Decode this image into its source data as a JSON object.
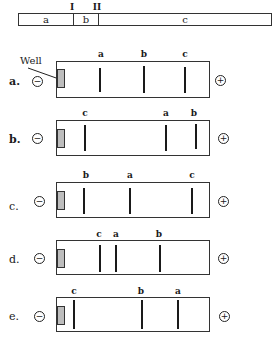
{
  "figure": {
    "map": {
      "segments": [
        {
          "label": "a",
          "width": 54
        },
        {
          "label": "b",
          "width": 25
        },
        {
          "label": "c",
          "width": 175
        }
      ],
      "cut_sites": [
        {
          "label": "I",
          "x": 72
        },
        {
          "label": "II",
          "x": 97
        }
      ]
    },
    "well_label": "Well",
    "electrodes": {
      "negative": "−",
      "positive": "+"
    },
    "gels": [
      {
        "label": "a.",
        "top": 61,
        "height": 37,
        "bands": [
          {
            "label": "a",
            "x": 100
          },
          {
            "label": "b",
            "x": 144
          },
          {
            "label": "c",
            "x": 185
          }
        ]
      },
      {
        "label": "b.",
        "top": 120,
        "height": 36,
        "bands": [
          {
            "label": "c",
            "x": 85
          },
          {
            "label": "a",
            "x": 166
          },
          {
            "label": "b",
            "x": 196
          }
        ]
      },
      {
        "label": "c.",
        "top": 182,
        "height": 36,
        "bands": [
          {
            "label": "b",
            "x": 84
          },
          {
            "label": "a",
            "x": 130
          },
          {
            "label": "c",
            "x": 192
          }
        ]
      },
      {
        "label": "d.",
        "top": 240,
        "height": 35,
        "bands": [
          {
            "label": "c",
            "x": 100
          },
          {
            "label": "a",
            "x": 116
          },
          {
            "label": "b",
            "x": 160
          }
        ]
      },
      {
        "label": "e.",
        "top": 297,
        "height": 35,
        "bands": [
          {
            "label": "c",
            "x": 74
          },
          {
            "label": "b",
            "x": 142
          },
          {
            "label": "a",
            "x": 178
          }
        ]
      }
    ],
    "colors": {
      "line": "#333333",
      "band": "#1a1a1a",
      "well_fill": "#bdbdbd",
      "background": "#ffffff"
    }
  }
}
